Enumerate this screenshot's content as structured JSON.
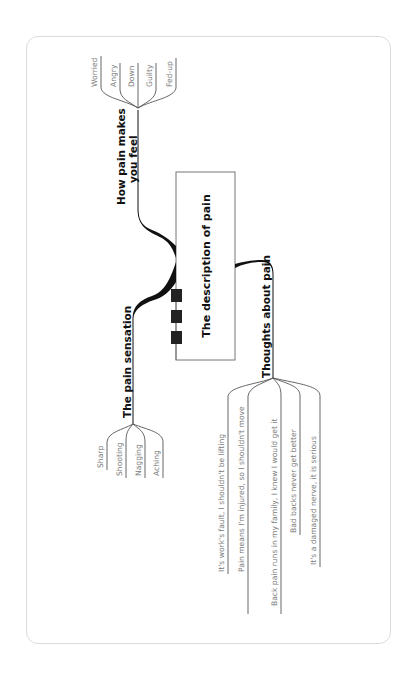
{
  "diagram": {
    "type": "mind-map",
    "orientation": "rotated-90-ccw",
    "center": {
      "label": "The description of pain"
    },
    "branches": [
      {
        "label": "How pain makes you feel",
        "label_lines": [
          "How pain makes",
          "you feel"
        ],
        "leaves": [
          "Worried",
          "Angry",
          "Down",
          "Guilty",
          "Fed-up"
        ]
      },
      {
        "label": "The pain sensation",
        "leaves": [
          "Sharp",
          "Shooting",
          "Nagging",
          "Aching"
        ]
      },
      {
        "label": "Thoughts about pain",
        "leaves": [
          "It's work's fault, I shouldn't be lifting",
          "Pain means I'm injured, so I shouldn't move",
          "Back pain runs in my family, I knew I would get it",
          "Bad backs never get better",
          "It's a damaged nerve, it is serious"
        ]
      }
    ],
    "colors": {
      "line": "#111111",
      "leaf_text": "#7a7a7a",
      "leaf_line": "#555555",
      "box_border": "#777777",
      "card_border": "#dcdcdc"
    }
  }
}
